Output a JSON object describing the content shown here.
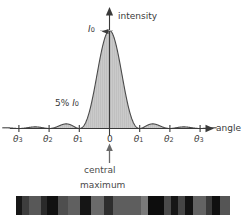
{
  "figure": {
    "title_visible": false,
    "background_color": "#ffffff",
    "ink_color": "#3a3a3a",
    "fill_color": "#c9c9c9"
  },
  "axes": {
    "y_axis_label": "intensity",
    "x_axis_label": "angle",
    "peak_label_main": "I",
    "peak_label_sub": "0",
    "sidelobe_annotation": {
      "percent": "5%",
      "symbol": "I",
      "symbol_sub": "0"
    },
    "origin_label": "0",
    "tick_labels_left": [
      {
        "symbol": "θ",
        "sub": "3"
      },
      {
        "symbol": "θ",
        "sub": "2"
      },
      {
        "symbol": "θ",
        "sub": "1"
      }
    ],
    "tick_labels_right": [
      {
        "symbol": "θ",
        "sub": "1"
      },
      {
        "symbol": "θ",
        "sub": "2"
      },
      {
        "symbol": "θ",
        "sub": "3"
      }
    ]
  },
  "caption": {
    "line1": "central",
    "line2": "maximum"
  },
  "chart_data": {
    "type": "line",
    "title": "",
    "subtitle": "",
    "xlabel": "angle",
    "ylabel": "intensity",
    "function": "I(u) = I0 * (sin(pi*u)/(pi*u))^2",
    "x_unit": "orders (u = multiples of theta1)",
    "xlim": [
      -3.55,
      3.55
    ],
    "ylim": [
      0,
      1.0
    ],
    "grid": false,
    "legend": false,
    "fill_under_curve": true,
    "x_tick_positions": [
      -3,
      -2,
      -1,
      0,
      1,
      2,
      3
    ],
    "x_tick_labels": [
      "θ3",
      "θ2",
      "θ1",
      "0",
      "θ1",
      "θ2",
      "θ3"
    ],
    "annotations": [
      {
        "text": "I0",
        "x": 0,
        "y": 1.0,
        "note": "peak intensity marker at central maximum"
      },
      {
        "text": "5% I0",
        "x": -1.5,
        "y": 0.047,
        "note": "first side lobe relative intensity"
      },
      {
        "text": "central maximum",
        "x": 0,
        "y": 0,
        "note": "arrow pointing up to origin on angle axis"
      }
    ],
    "series": [
      {
        "name": "intensity",
        "x": [
          -3.5,
          -3.25,
          -3.0,
          -2.75,
          -2.5,
          -2.25,
          -2.0,
          -1.75,
          -1.5,
          -1.25,
          -1.0,
          -0.875,
          -0.75,
          -0.625,
          -0.5,
          -0.375,
          -0.25,
          -0.125,
          0,
          0.125,
          0.25,
          0.375,
          0.5,
          0.625,
          0.75,
          0.875,
          1.0,
          1.25,
          1.5,
          1.75,
          2.0,
          2.25,
          2.5,
          2.75,
          3.0,
          3.25,
          3.5
        ],
        "y": [
          0.0083,
          0.0,
          0.0,
          0.0,
          0.0165,
          0.0,
          0.0,
          0.0,
          0.0472,
          0.0,
          0.0,
          0.0402,
          0.1283,
          0.2546,
          0.4053,
          0.5727,
          0.7368,
          0.873,
          1.0,
          0.873,
          0.7368,
          0.5727,
          0.4053,
          0.2546,
          0.1283,
          0.0402,
          0.0,
          0.0,
          0.0472,
          0.0,
          0.0,
          0.0,
          0.0165,
          0.0,
          0.0,
          0.0,
          0.0083
        ]
      }
    ],
    "lobe_peaks": [
      {
        "order": 0,
        "x": 0,
        "relative_intensity": 1.0,
        "label": "I0"
      },
      {
        "order": 1,
        "x": 1.43,
        "relative_intensity": 0.047,
        "label": "5% I0"
      },
      {
        "order": 2,
        "x": 2.46,
        "relative_intensity": 0.017
      },
      {
        "order": 3,
        "x": 3.47,
        "relative_intensity": 0.008
      }
    ]
  },
  "pattern_strip": {
    "description": "photographic single-slit diffraction fringe pattern",
    "bands": [
      {
        "x_pct": 0.0,
        "w_pct": 2.8,
        "color": "#171717"
      },
      {
        "x_pct": 2.8,
        "w_pct": 3.3,
        "color": "#3d3d3d"
      },
      {
        "x_pct": 6.1,
        "w_pct": 5.6,
        "color": "#585858"
      },
      {
        "x_pct": 11.7,
        "w_pct": 2.8,
        "color": "#2a2a2a"
      },
      {
        "x_pct": 14.5,
        "w_pct": 5.1,
        "color": "#111111"
      },
      {
        "x_pct": 19.6,
        "w_pct": 4.7,
        "color": "#4e4e4e"
      },
      {
        "x_pct": 24.3,
        "w_pct": 5.6,
        "color": "#606060"
      },
      {
        "x_pct": 29.9,
        "w_pct": 5.1,
        "color": "#151515"
      },
      {
        "x_pct": 35.0,
        "w_pct": 6.1,
        "color": "#6a6a6a"
      },
      {
        "x_pct": 41.1,
        "w_pct": 4.2,
        "color": "#2e2e2e"
      },
      {
        "x_pct": 45.3,
        "w_pct": 13.1,
        "color": "#5e5e5e"
      },
      {
        "x_pct": 58.4,
        "w_pct": 3.3,
        "color": "#7a7a7a"
      },
      {
        "x_pct": 61.7,
        "w_pct": 7.5,
        "color": "#0d0d0d"
      },
      {
        "x_pct": 69.2,
        "w_pct": 3.3,
        "color": "#4a4a4a"
      },
      {
        "x_pct": 72.5,
        "w_pct": 3.3,
        "color": "#161616"
      },
      {
        "x_pct": 75.8,
        "w_pct": 3.3,
        "color": "#454545"
      },
      {
        "x_pct": 79.1,
        "w_pct": 3.7,
        "color": "#121212"
      },
      {
        "x_pct": 82.8,
        "w_pct": 6.1,
        "color": "#636363"
      },
      {
        "x_pct": 88.9,
        "w_pct": 2.8,
        "color": "#3a3a3a"
      },
      {
        "x_pct": 91.7,
        "w_pct": 3.7,
        "color": "#101010"
      },
      {
        "x_pct": 95.4,
        "w_pct": 4.6,
        "color": "#555555"
      }
    ]
  }
}
